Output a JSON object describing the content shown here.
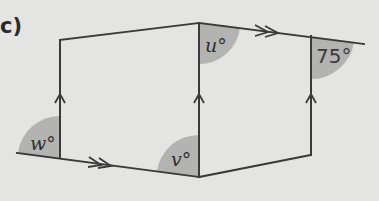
{
  "diagram": {
    "part_label": "c)",
    "angles": {
      "w": "w°",
      "v": "v°",
      "u": "u°",
      "given": "75°"
    },
    "colors": {
      "background": "#e4e4e2",
      "line": "#3a3a3a",
      "angle_fill": "#b3b3b1"
    },
    "parallel_marks": {
      "single_arrow_lines": [
        "left-vertical",
        "middle-vertical",
        "right-vertical"
      ],
      "double_arrow_lines": [
        "bottom-left-transversal",
        "top-right-transversal"
      ]
    }
  }
}
